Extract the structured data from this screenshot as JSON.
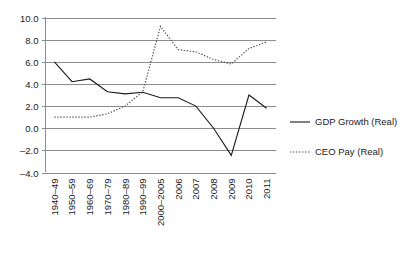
{
  "chart_data": {
    "type": "line",
    "title": "",
    "subtitle": "",
    "xlabel": "",
    "ylabel": "",
    "categories": [
      "1940–49",
      "1950–59",
      "1960–69",
      "1970–79",
      "1980–89",
      "1990–99",
      "2000–2005",
      "2006",
      "2007",
      "2008",
      "2009",
      "2010",
      "2011"
    ],
    "ylim": [
      -4.0,
      10.0
    ],
    "ytick_step": 2.0,
    "ytick_labels": [
      "10.0",
      "8.0",
      "6.0",
      "4.0",
      "2.0",
      "0.0",
      "–2.0",
      "–4.0"
    ],
    "ytick_values": [
      10.0,
      8.0,
      6.0,
      4.0,
      2.0,
      0.0,
      -2.0,
      -4.0
    ],
    "grid": "horizontal",
    "legend_position": "right",
    "series": [
      {
        "name": "GDP Growth (Real)",
        "style": "solid",
        "color": "#1a1a1a",
        "values": [
          6.0,
          4.2,
          4.45,
          3.3,
          3.1,
          3.25,
          2.75,
          2.75,
          2.0,
          0.0,
          -2.45,
          3.0,
          1.8
        ]
      },
      {
        "name": "CEO Pay (Real)",
        "style": "dotted",
        "color": "#555555",
        "values": [
          1.0,
          1.0,
          1.0,
          1.3,
          2.0,
          3.3,
          9.2,
          7.1,
          6.9,
          6.2,
          5.8,
          7.2,
          7.8
        ]
      }
    ]
  },
  "legend": {
    "items": [
      {
        "label": "GDP Growth (Real)",
        "style": "solid"
      },
      {
        "label": "CEO Pay (Real)",
        "style": "dotted"
      }
    ]
  },
  "colors": {
    "background": "#ffffff",
    "grid": "#8c8c8c",
    "axis": "#8c8c8c",
    "series_gdp": "#1a1a1a",
    "series_ceo": "#555555",
    "text": "#1a1a1a"
  }
}
